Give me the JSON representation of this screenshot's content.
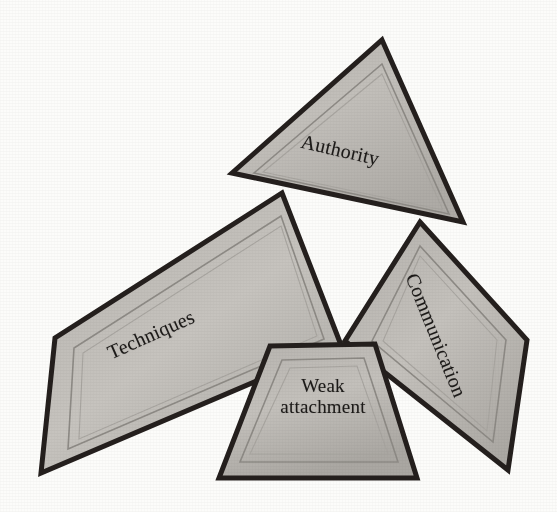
{
  "diagram": {
    "background_color": "#fcfcfa",
    "outline_color": "#241f1d",
    "fill_color": "#b9b6b1",
    "inner_line_color": "#8d8a85",
    "text_color": "#1c1a18",
    "shapes": [
      {
        "id": "authority",
        "label": "Authority",
        "geometry": "triangle",
        "label_rotation_deg": 13,
        "points": "382,40 463,222 232,173",
        "inner_points": "382,64 449,214 254,173",
        "inner_points2": "382,74 443,210 263,172"
      },
      {
        "id": "techniques",
        "label": "Techniques",
        "geometry": "quadrilateral",
        "label_rotation_deg": -24,
        "points": "282,193 341,345 41,473 55,338",
        "inner_points": "281,216 324,339 68,449 74,348",
        "inner_points2": "281,226 317,336 79,439 83,353"
      },
      {
        "id": "communication",
        "label": "Communication",
        "geometry": "quadrilateral",
        "label_rotation_deg": 68,
        "points": "420,222 527,340 508,470 345,341",
        "inner_points": "420,246 506,340 493,442 372,341",
        "inner_points2": "420,256 497,340 487,431 383,341"
      },
      {
        "id": "weak-attachment",
        "label": "Weak attachment",
        "label_line1": "Weak",
        "label_line2": "attachment",
        "geometry": "trapezoid",
        "label_rotation_deg": 0,
        "points": "270,346 375,344 417,478 219,478",
        "inner_points": "282,360 364,358 398,462 240,462",
        "inner_points2": "290,368 357,366 388,454 250,454"
      }
    ]
  }
}
